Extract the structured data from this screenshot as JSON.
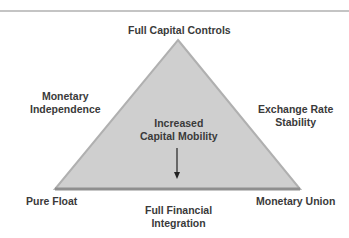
{
  "diagram": {
    "title_top": "Full Capital Controls",
    "left_side": [
      "Monetary",
      "Independence"
    ],
    "right_side": [
      "Exchange Rate",
      "Stability"
    ],
    "center": [
      "Increased",
      "Capital Mobility"
    ],
    "bottom_left": "Pure Float",
    "bottom_right": "Monetary Union",
    "bottom_center": [
      "Full Financial",
      "Integration"
    ],
    "colors": {
      "triangle_fill": "#cfcfcf",
      "triangle_edge": "#a8a8a8",
      "base_edge": "#8f8f8f",
      "text": "#3a3a3a",
      "rule": "#c4c4c4"
    }
  }
}
